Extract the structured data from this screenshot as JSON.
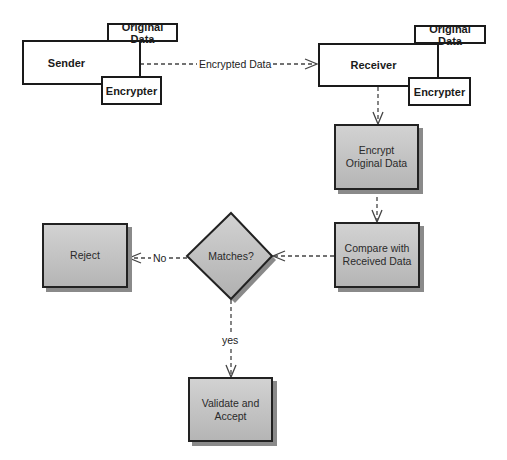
{
  "diagram": {
    "sender": {
      "label": "Sender",
      "original_data": "Original Data",
      "encrypter": "Encrypter"
    },
    "receiver": {
      "label": "Receiver",
      "original_data": "Original Data",
      "encrypter": "Encrypter"
    },
    "edges": {
      "sender_to_receiver": "Encrypted Data",
      "matches_to_reject": "No",
      "matches_to_validate": "yes"
    },
    "steps": {
      "encrypt_original": "Encrypt Original Data",
      "compare": "Compare with Received Data",
      "decision": "Matches?",
      "reject": "Reject",
      "validate": "Validate and Accept"
    },
    "colors": {
      "process_fill_top": "#d2d2d2",
      "process_fill_bottom": "#b5b5b5",
      "stroke": "#1a1a1a",
      "shadow": "#8a8a8a"
    }
  }
}
